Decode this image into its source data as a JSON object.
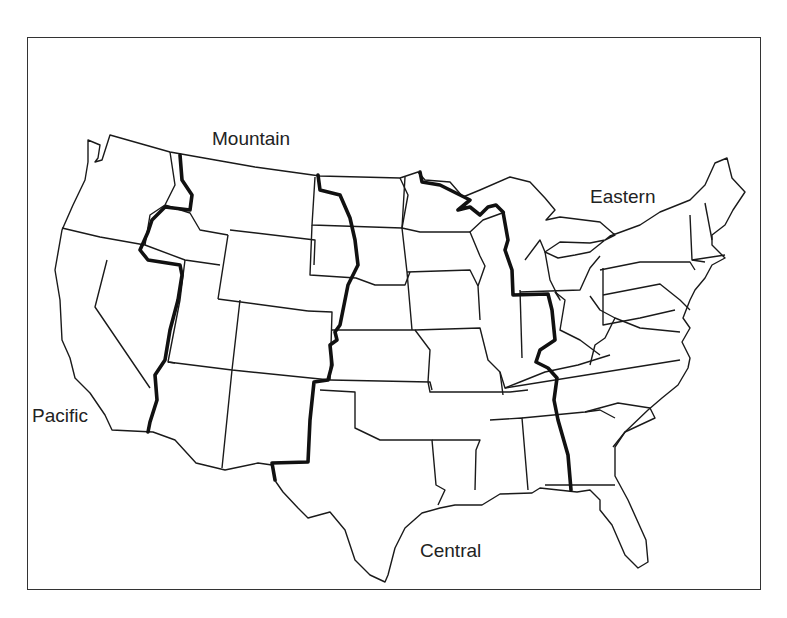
{
  "map": {
    "title": "U.S. Time Zones",
    "zones": [
      {
        "name": "Pacific",
        "label": "Pacific"
      },
      {
        "name": "Mountain",
        "label": "Mountain"
      },
      {
        "name": "Central",
        "label": "Central"
      },
      {
        "name": "Eastern",
        "label": "Eastern"
      }
    ],
    "colors": {
      "border": "#333333",
      "state_line": "#1a1a1a",
      "zone_line": "#111111",
      "background": "#ffffff"
    }
  }
}
